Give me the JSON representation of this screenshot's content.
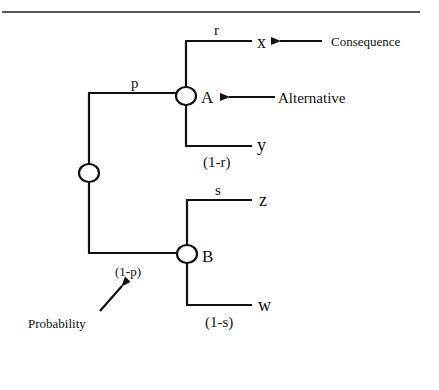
{
  "diagram": {
    "type": "decision-tree",
    "nodes": {
      "root": {
        "label": ""
      },
      "A": {
        "label": "A"
      },
      "B": {
        "label": "B"
      }
    },
    "branches": {
      "root_to_A": {
        "probability": "p"
      },
      "root_to_B": {
        "probability": "(1-p)"
      },
      "A_to_x": {
        "probability": "r",
        "outcome": "x"
      },
      "A_to_y": {
        "probability": "(1-r)",
        "outcome": "y"
      },
      "B_to_z": {
        "probability": "s",
        "outcome": "z"
      },
      "B_to_w": {
        "probability": "(1-s)",
        "outcome": "w"
      }
    },
    "annotations": {
      "consequence": "Consequence",
      "alternative": "Alternative",
      "probability": "Probability"
    },
    "colors": {
      "ink": "#111111",
      "background": "#ffffff"
    }
  }
}
